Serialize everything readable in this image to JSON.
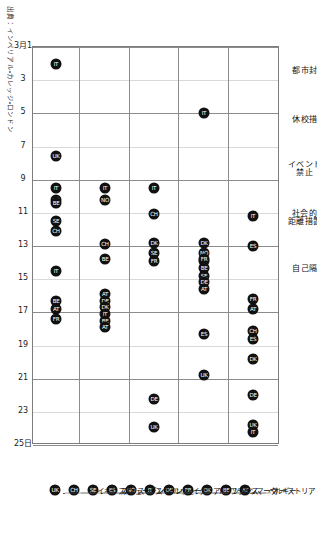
{
  "figure": {
    "source_note": "出典：インペリアル・カレッジ・ロンドン",
    "date_axis_start_label": "3月1",
    "date_axis_end_label": "25日"
  },
  "chart_data": {
    "type": "scatter",
    "title": "",
    "xlabel": "",
    "ylabel": "",
    "orientation": "rotated-90-clockwise",
    "grid": true,
    "legend_position": "right",
    "xlim": [
      1,
      25
    ],
    "x_tick_labels": [
      "3月1",
      "3",
      "5",
      "7",
      "9",
      "11",
      "13",
      "15",
      "17",
      "19",
      "21",
      "23",
      "25日"
    ],
    "x_ticks": [
      1,
      3,
      5,
      7,
      9,
      11,
      13,
      15,
      17,
      19,
      21,
      23,
      25
    ],
    "categories": [
      "都市封鎖",
      "休校措置",
      "イベント\n禁止",
      "社会的\n距離措置",
      "自己隔離"
    ],
    "legend": [
      {
        "code": "AT",
        "label": "オーストリア"
      },
      {
        "code": "BE",
        "label": "ベルギー"
      },
      {
        "code": "DK",
        "label": "デンマーク"
      },
      {
        "code": "FR",
        "label": "フランス"
      },
      {
        "code": "DE",
        "label": "ドイツ"
      },
      {
        "code": "IT",
        "label": "イタリア"
      },
      {
        "code": "NO",
        "label": "ノルウェー"
      },
      {
        "code": "ES",
        "label": "スペイン"
      },
      {
        "code": "SE",
        "label": "スウェーデン"
      },
      {
        "code": "CH",
        "label": "スイス"
      },
      {
        "code": "UK",
        "label": "イギリス"
      }
    ],
    "points": [
      {
        "category": "自己隔離",
        "country": "イタリア",
        "code": "IT",
        "date": 2
      },
      {
        "category": "休校措置",
        "country": "イタリア",
        "code": "IT",
        "date": 5
      },
      {
        "category": "自己隔離",
        "country": "イギリス",
        "code": "UK",
        "date": 7.6
      },
      {
        "category": "イベント禁止",
        "category_key": "イベント\n禁止",
        "country": "イタリア",
        "code": "IT",
        "date": 9.5
      },
      {
        "category": "社会的距離措置",
        "category_key": "社会的\n距離措置",
        "country": "イタリア",
        "code": "IT",
        "date": 9.5
      },
      {
        "category": "社会的距離措置",
        "category_key": "社会的\n距離措置",
        "country": "ノルウェー",
        "code": "NO",
        "date": 10.2
      },
      {
        "category": "自己隔離",
        "country": "イタリア",
        "code": "IT",
        "date": 9.5
      },
      {
        "category": "自己隔離",
        "country": "スペイン",
        "code": "ES",
        "date": 10.2
      },
      {
        "category": "自己隔離",
        "country": "ベルギー",
        "code": "BE",
        "date": 10.4
      },
      {
        "category": "都市封鎖",
        "country": "イタリア",
        "code": "IT",
        "date": 11.2
      },
      {
        "category": "イベント禁止",
        "category_key": "イベント\n禁止",
        "country": "スイス",
        "code": "CH",
        "date": 11.1
      },
      {
        "category": "自己隔離",
        "country": "スウェーデン",
        "code": "SE",
        "date": 11.5
      },
      {
        "category": "自己隔離",
        "country": "スイス",
        "code": "CH",
        "date": 12.1
      },
      {
        "category": "都市封鎖",
        "country": "スペイン",
        "code": "ES",
        "date": 13.0
      },
      {
        "category": "休校措置",
        "country": "デンマーク",
        "code": "DK",
        "date": 12.8
      },
      {
        "category": "休校措置",
        "country": "ノルウェー",
        "code": "NO",
        "date": 13.4
      },
      {
        "category": "休校措置",
        "country": "スイス",
        "code": "CH",
        "date": 13.9
      },
      {
        "category": "イベント禁止",
        "category_key": "イベント\n禁止",
        "country": "デンマーク",
        "code": "DK",
        "date": 12.8
      },
      {
        "category": "イベント禁止",
        "category_key": "イベント\n禁止",
        "country": "スウェーデン",
        "code": "SE",
        "date": 13.4
      },
      {
        "category": "社会的距離措置",
        "category_key": "社会的\n距離措置",
        "country": "スイス",
        "code": "CH",
        "date": 12.9
      },
      {
        "category": "休校措置",
        "country": "フランス",
        "code": "FR",
        "date": 13.8
      },
      {
        "category": "休校措置",
        "country": "ベルギー",
        "code": "BE",
        "date": 14.3
      },
      {
        "category": "休校措置",
        "country": "スウェーデン",
        "code": "SE",
        "date": 14.8
      },
      {
        "category": "休校措置",
        "country": "ドイツ",
        "code": "DE",
        "date": 15.2
      },
      {
        "category": "休校措置",
        "country": "オーストリア",
        "code": "AT",
        "date": 15.6
      },
      {
        "category": "イベント禁止",
        "category_key": "イベント\n禁止",
        "country": "フランス",
        "code": "FR",
        "date": 13.9
      },
      {
        "category": "社会的距離措置",
        "category_key": "社会的\n距離措置",
        "country": "ベルギー",
        "code": "BE",
        "date": 13.8
      },
      {
        "category": "自己隔離",
        "country": "イタリア",
        "code": "IT",
        "date": 14.5
      },
      {
        "category": "都市封鎖",
        "country": "フランス",
        "code": "FR",
        "date": 16.2
      },
      {
        "category": "都市封鎖",
        "country": "オーストリア",
        "code": "AT",
        "date": 16.8
      },
      {
        "category": "社会的距離措置",
        "category_key": "社会的\n距離措置",
        "country": "オーストリア",
        "code": "AT",
        "date": 15.9
      },
      {
        "category": "社会的距離措置",
        "category_key": "社会的\n距離措置",
        "country": "ドイツ",
        "code": "DE",
        "date": 16.3
      },
      {
        "category": "社会的距離措置",
        "category_key": "社会的\n距離措置",
        "country": "デンマーク",
        "code": "DK",
        "date": 16.7
      },
      {
        "category": "社会的距離措置",
        "category_key": "社会的\n距離措置",
        "country": "イタリア",
        "code": "IT",
        "date": 17.1
      },
      {
        "category": "社会的距離措置",
        "category_key": "社会的\n距離措置",
        "country": "ベルギー",
        "code": "BE",
        "date": 17.5
      },
      {
        "category": "社会的距離措置",
        "category_key": "社会的\n距離措置",
        "country": "オーストリア",
        "code": "AT",
        "date": 17.9
      },
      {
        "category": "自己隔離",
        "country": "ベルギー",
        "code": "BE",
        "date": 16.3
      },
      {
        "category": "自己隔離",
        "country": "オーストリア",
        "code": "AT",
        "date": 16.8
      },
      {
        "category": "自己隔離",
        "country": "フランス",
        "code": "FR",
        "date": 17.4
      },
      {
        "category": "都市封鎖",
        "country": "スイス",
        "code": "CH",
        "date": 18.1
      },
      {
        "category": "都市封鎖",
        "country": "スペイン",
        "code": "ES",
        "date": 18.6
      },
      {
        "category": "休校措置",
        "country": "スペイン",
        "code": "ES",
        "date": 18.3
      },
      {
        "category": "都市封鎖",
        "country": "デンマーク",
        "code": "DK",
        "date": 19.8
      },
      {
        "category": "休校措置",
        "country": "イギリス",
        "code": "UK",
        "date": 20.8
      },
      {
        "category": "都市封鎖",
        "country": "ドイツ",
        "code": "DE",
        "date": 22.0
      },
      {
        "category": "イベント禁止",
        "category_key": "イベント\n禁止",
        "country": "ドイツ",
        "code": "DE",
        "date": 22.2
      },
      {
        "category": "都市封鎖",
        "country": "イギリス",
        "code": "UK",
        "date": 23.8
      },
      {
        "category": "都市封鎖",
        "country": "イタリア",
        "code": "IT",
        "date": 24.2
      },
      {
        "category": "イベント禁止",
        "category_key": "イベント\n禁止",
        "country": "イギリス",
        "code": "UK",
        "date": 23.9
      }
    ]
  }
}
